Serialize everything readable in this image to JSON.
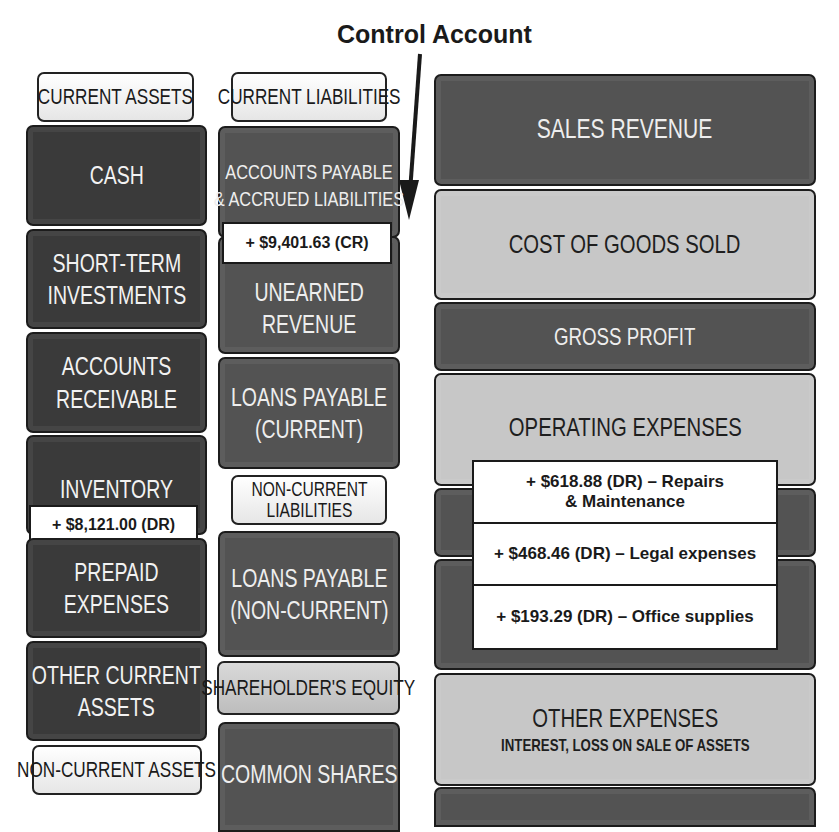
{
  "title": "Control Account",
  "colors": {
    "dark_tile": "#3a3a3a",
    "mid_tile": "#535353",
    "light_tile": "#c7c7c7",
    "header_bg": "#ffffff",
    "note_bg": "#ffffff",
    "text_dark": "#1a1a1a",
    "text_light": "#f2f2f2"
  },
  "assets": {
    "header": "CURRENT ASSETS",
    "items": [
      {
        "label": "CASH"
      },
      {
        "label": "SHORT-TERM INVESTMENTS"
      },
      {
        "label": "ACCOUNTS RECEIVABLE"
      },
      {
        "label": "INVENTORY"
      },
      {
        "label": "PREPAID EXPENSES"
      },
      {
        "label": "OTHER CURRENT ASSETS"
      }
    ],
    "inventory_note": "+ $8,121.00 (DR)",
    "non_current_header": "NON-CURRENT ASSETS"
  },
  "liabilities": {
    "header": "CURRENT LIABILITIES",
    "items": [
      {
        "label_line1": "ACCOUNTS PAYABLE",
        "label_line2": "& ACCRUED LIABILITIES"
      },
      {
        "label_line1": "UNEARNED",
        "label_line2": "REVENUE"
      },
      {
        "label_line1": "LOANS PAYABLE",
        "label_line2": "(CURRENT)"
      }
    ],
    "accounts_payable_note": "+ $9,401.63 (CR)",
    "non_current_header_line1": "NON-CURRENT",
    "non_current_header_line2": "LIABILITIES",
    "non_current_items": [
      {
        "label_line1": "LOANS PAYABLE",
        "label_line2": "(NON-CURRENT)"
      }
    ],
    "equity_header": "SHAREHOLDER'S EQUITY",
    "equity_items": [
      {
        "label": "COMMON SHARES"
      }
    ]
  },
  "income_statement": {
    "items": [
      {
        "label": "SALES REVENUE"
      },
      {
        "label": "COST OF GOODS SOLD"
      },
      {
        "label": "GROSS PROFIT"
      },
      {
        "label": "OPERATING EXPENSES"
      },
      {
        "label": "OTHER EXPENSES",
        "sublabel": "INTEREST, LOSS ON SALE OF ASSETS"
      }
    ],
    "expense_notes": [
      {
        "line1": "+ $618.88 (DR) – Repairs",
        "line2": "& Maintenance"
      },
      {
        "line1": "+ $468.46 (DR) – Legal expenses"
      },
      {
        "line1": "+ $193.29 (DR) – Office supplies"
      }
    ]
  }
}
